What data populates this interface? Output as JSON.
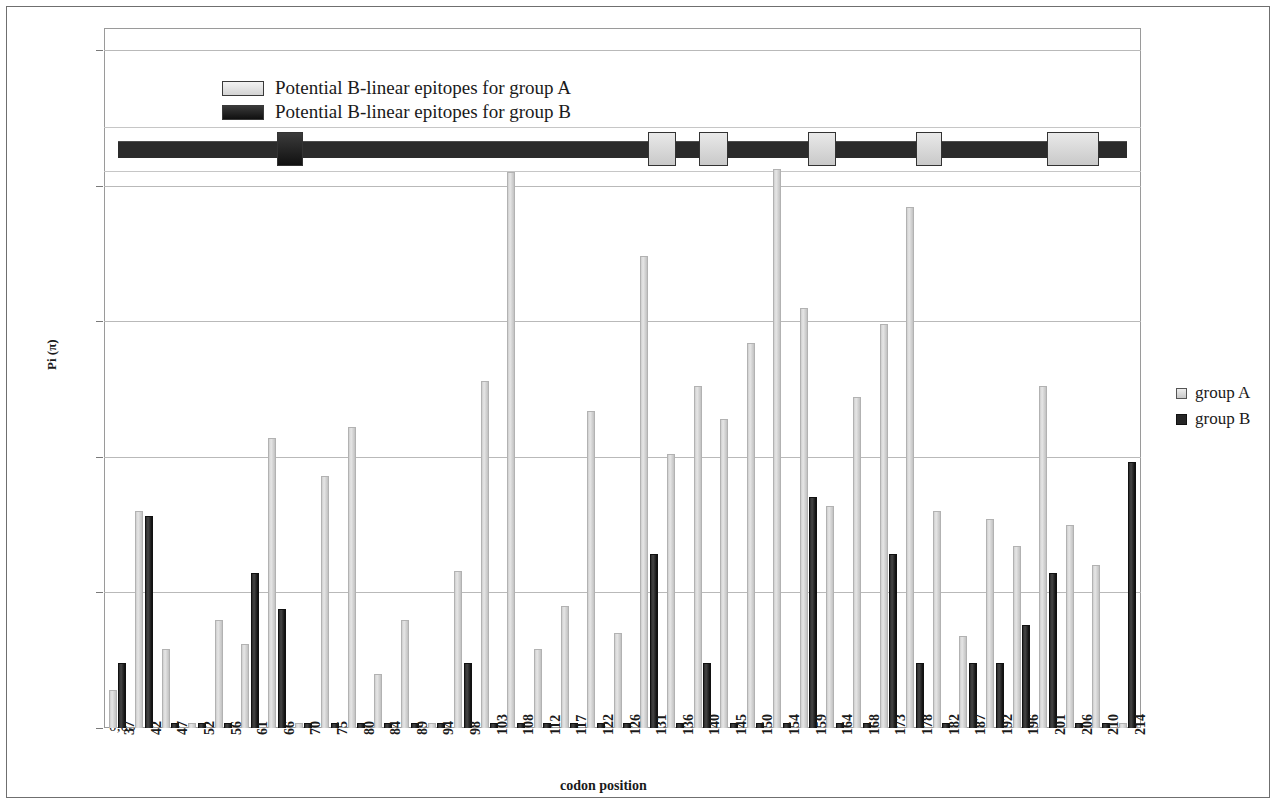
{
  "figure": {
    "y_axis_label": "Pi (π)",
    "x_axis_label": "codon position"
  },
  "top_legend": {
    "items": [
      {
        "label": "Potential B-linear epitopes for group A",
        "swatch": "light-gray",
        "color": "#d9d9d9"
      },
      {
        "label": "Potential B-linear epitopes for group B",
        "swatch": "black",
        "color": "#1a1a1a"
      }
    ]
  },
  "right_legend": {
    "items": [
      {
        "label": "group A",
        "color": "#d9d9d9"
      },
      {
        "label": "group B",
        "color": "#262626"
      }
    ]
  },
  "epitope_track": {
    "description": "horizontal protein track with epitope boxes",
    "line_color": "#2b2b2b",
    "boxes": [
      {
        "group": "B",
        "start_codon": 66,
        "end_codon": 70,
        "color": "#1a1a1a"
      },
      {
        "group": "A",
        "start_codon": 131,
        "end_codon": 136,
        "color": "#d9d9d9"
      },
      {
        "group": "A",
        "start_codon": 140,
        "end_codon": 145,
        "color": "#d9d9d9"
      },
      {
        "group": "A",
        "start_codon": 159,
        "end_codon": 164,
        "color": "#d9d9d9"
      },
      {
        "group": "A",
        "start_codon": 178,
        "end_codon": 182,
        "color": "#d9d9d9"
      },
      {
        "group": "A",
        "start_codon": 201,
        "end_codon": 210,
        "color": "#d9d9d9"
      }
    ]
  },
  "chart_data": {
    "type": "bar",
    "title": "",
    "xlabel": "codon position",
    "ylabel": "Pi (π)",
    "ylim": [
      0.0,
      0.25
    ],
    "ytick_labels": [
      "0,00",
      "0,05",
      "0,10",
      "0,15",
      "0,20",
      "0,25"
    ],
    "ytick_values": [
      0.0,
      0.05,
      0.1,
      0.15,
      0.2,
      0.25
    ],
    "grid": true,
    "legend_position": "right",
    "categories": [
      37,
      42,
      47,
      52,
      56,
      61,
      66,
      70,
      75,
      80,
      84,
      89,
      94,
      98,
      103,
      108,
      112,
      117,
      122,
      126,
      131,
      136,
      140,
      145,
      150,
      154,
      159,
      164,
      168,
      173,
      178,
      182,
      187,
      192,
      196,
      201,
      206,
      210,
      214
    ],
    "series": [
      {
        "name": "group A",
        "color": "#d9d9d9",
        "values": [
          0.014,
          0.08,
          0.029,
          0.002,
          0.04,
          0.031,
          0.107,
          0.002,
          0.093,
          0.111,
          0.02,
          0.04,
          0.002,
          0.058,
          0.128,
          0.205,
          0.029,
          0.045,
          0.117,
          0.035,
          0.174,
          0.101,
          0.126,
          0.114,
          0.142,
          0.206,
          0.155,
          0.082,
          0.122,
          0.149,
          0.192,
          0.08,
          0.034,
          0.077,
          0.067,
          0.126,
          0.075,
          0.06,
          0.002
        ]
      },
      {
        "name": "group B",
        "color": "#262626",
        "values": [
          0.024,
          0.078,
          0.002,
          0.002,
          0.002,
          0.057,
          0.044,
          0.002,
          0.002,
          0.002,
          0.002,
          0.002,
          0.002,
          0.024,
          0.002,
          0.002,
          0.002,
          0.002,
          0.002,
          0.002,
          0.064,
          0.002,
          0.024,
          0.002,
          0.002,
          0.002,
          0.085,
          0.002,
          0.002,
          0.064,
          0.024,
          0.002,
          0.024,
          0.024,
          0.038,
          0.057,
          0.002,
          0.002,
          0.098
        ]
      }
    ]
  }
}
